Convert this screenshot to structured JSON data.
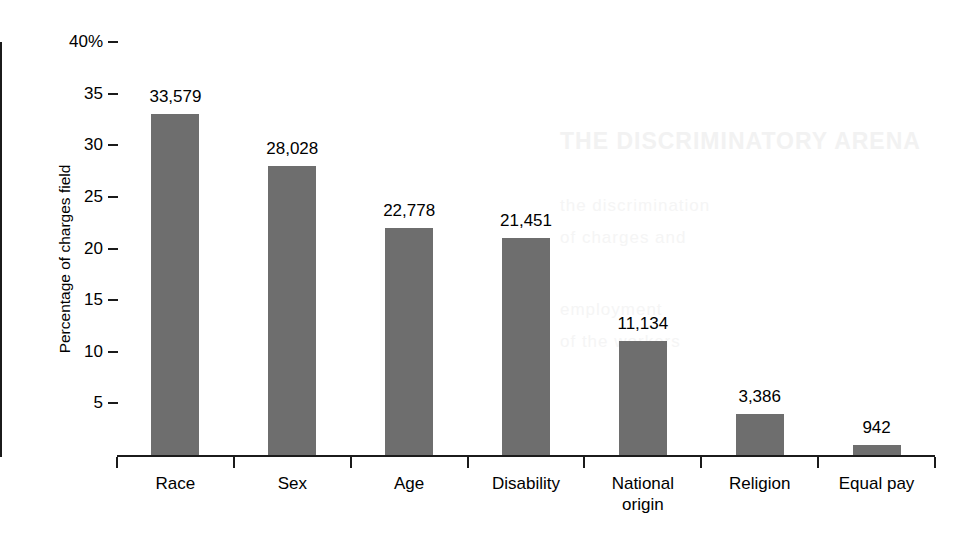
{
  "chart_data": {
    "type": "bar",
    "title": "",
    "xlabel": "",
    "ylabel": "Percentage of charges field",
    "categories": [
      "Race",
      "Sex",
      "Age",
      "Disability",
      "National\norigin",
      "Religion",
      "Equal pay"
    ],
    "values": [
      33,
      28,
      22,
      21,
      11,
      4,
      1
    ],
    "data_labels": [
      "33,579",
      "28,028",
      "22,778",
      "21,451",
      "11,134",
      "3,386",
      "942"
    ],
    "counts": [
      33579,
      28028,
      22778,
      21451,
      11134,
      3386,
      942
    ],
    "ylim": [
      0,
      40
    ],
    "ytick_values": [
      0,
      5,
      10,
      15,
      20,
      25,
      30,
      35,
      40
    ],
    "ytick_labels": [
      "",
      "5",
      "10",
      "15",
      "20",
      "25",
      "30",
      "35",
      "40%"
    ],
    "grid": false,
    "legend": false,
    "legend_position": "none",
    "bar_color": "#6e6e6e",
    "axis_color": "#1b1b1b",
    "background_color": "#ffffff"
  },
  "ghost_text": {
    "heading": "THE DISCRIMINATORY ARENA",
    "line1": "the discrimination",
    "line2": "of charges and",
    "line3": "employment",
    "line4": "of the workers"
  }
}
